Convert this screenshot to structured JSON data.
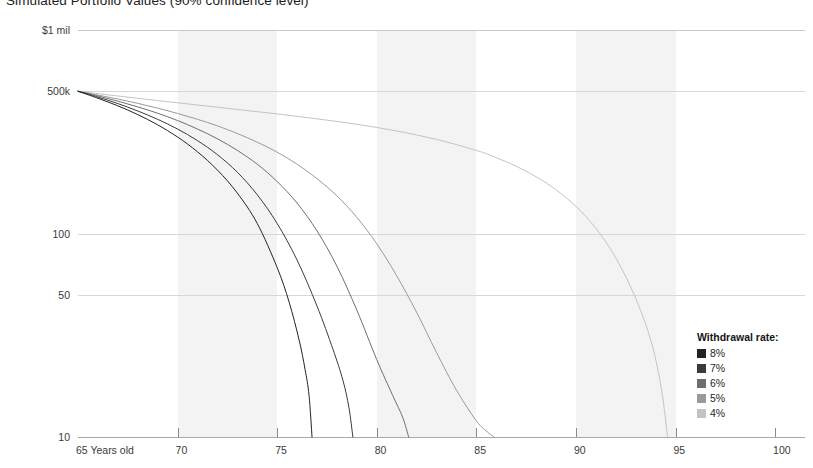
{
  "chart_data": {
    "type": "line",
    "title": "Simulated Portfolio Values (90% confidence level)",
    "xlabel": "",
    "ylabel": "",
    "yscale": "log",
    "grid": true,
    "legend_position": "right-inside",
    "legend_title": "Withdrawal rate:",
    "x_axis": {
      "ticks": [
        65,
        70,
        75,
        80,
        85,
        90,
        95,
        100
      ],
      "tick_labels": [
        "65 Years old",
        "70",
        "75",
        "80",
        "85",
        "90",
        "95",
        "100"
      ],
      "range": [
        65,
        101.5
      ]
    },
    "y_axis": {
      "ticks": [
        1000000,
        500000,
        100000,
        50000,
        10000
      ],
      "tick_labels": [
        "$1 mil",
        "500k",
        "100",
        "50",
        "10"
      ],
      "range": [
        10000,
        1000000
      ]
    },
    "band_intervals": [
      [
        70,
        75
      ],
      [
        80,
        85
      ],
      [
        90,
        95
      ]
    ],
    "series": [
      {
        "name": "8%",
        "color": "#232323",
        "x": [
          65,
          66,
          67,
          68,
          69,
          70,
          71,
          72,
          73,
          74,
          75,
          75.6,
          76.1,
          76.4,
          76.6,
          76.75
        ],
        "y": [
          500000,
          462000,
          424000,
          384000,
          342000,
          298000,
          252000,
          205000,
          158000,
          112000,
          68000,
          46000,
          30000,
          21500,
          16000,
          10000
        ]
      },
      {
        "name": "7%",
        "color": "#3b3b3b",
        "x": [
          65,
          66,
          67,
          68,
          69,
          70,
          71,
          72,
          73,
          74,
          75,
          76,
          77,
          77.8,
          78.3,
          78.6,
          78.8
        ],
        "y": [
          500000,
          468000,
          435000,
          400000,
          364000,
          326000,
          286000,
          244000,
          200000,
          155000,
          112000,
          74000,
          44000,
          27000,
          19000,
          14000,
          10000
        ]
      },
      {
        "name": "6%",
        "color": "#6e6e6e",
        "x": [
          65,
          66,
          67,
          68,
          69,
          70,
          71,
          72,
          73,
          74,
          75,
          76,
          77,
          78,
          79,
          80,
          80.8,
          81.3,
          81.6
        ],
        "y": [
          500000,
          474000,
          447000,
          419000,
          390000,
          359000,
          326000,
          292000,
          256000,
          219000,
          180000,
          141000,
          103000,
          69000,
          42000,
          24000,
          16000,
          12500,
          10000
        ]
      },
      {
        "name": "5%",
        "color": "#9a9a9a",
        "x": [
          65,
          66,
          67,
          68,
          69,
          70,
          71,
          72,
          73,
          74,
          75,
          76,
          77,
          78,
          79,
          80,
          81,
          82,
          83,
          84,
          85,
          85.6,
          85.9
        ],
        "y": [
          500000,
          479000,
          458000,
          436000,
          413000,
          389000,
          364000,
          338000,
          310000,
          281000,
          251000,
          219000,
          186000,
          153000,
          120000,
          89000,
          62000,
          41000,
          26000,
          17000,
          12000,
          10500,
          10000
        ]
      },
      {
        "name": "4%",
        "color": "#c4c4c4",
        "x": [
          65,
          67,
          69,
          71,
          73,
          75,
          77,
          79,
          81,
          83,
          85,
          86,
          87,
          88,
          89,
          90,
          91,
          92,
          93,
          93.8,
          94.3,
          94.6
        ],
        "y": [
          500000,
          474000,
          450000,
          428000,
          407000,
          387000,
          366000,
          344000,
          319000,
          290000,
          256000,
          236000,
          214000,
          190000,
          164000,
          136000,
          106000,
          76000,
          48000,
          29000,
          17000,
          10000
        ]
      }
    ],
    "legend_entries": [
      {
        "label": "8%",
        "color": "#232323"
      },
      {
        "label": "7%",
        "color": "#3b3b3b"
      },
      {
        "label": "6%",
        "color": "#6e6e6e"
      },
      {
        "label": "5%",
        "color": "#9a9a9a"
      },
      {
        "label": "4%",
        "color": "#c4c4c4"
      }
    ]
  }
}
